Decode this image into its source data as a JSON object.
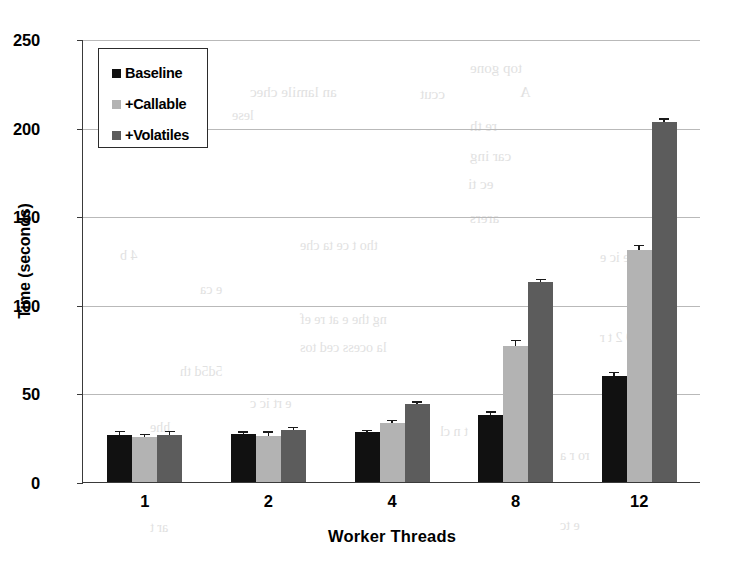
{
  "chart_data": {
    "type": "bar",
    "title": "",
    "xlabel": "Worker Threads",
    "ylabel": "Time (seconds)",
    "categories": [
      "1",
      "2",
      "4",
      "8",
      "12"
    ],
    "ylim": [
      0,
      250
    ],
    "yticks": [
      0,
      50,
      100,
      150,
      200,
      250
    ],
    "grid": true,
    "legend_position": "upper-left-inside",
    "series": [
      {
        "name": "Baseline",
        "color": "#111111",
        "values": [
          26.5,
          27.0,
          28.0,
          38.0,
          60.0
        ],
        "errors": [
          1.5,
          0.8,
          0.8,
          1.2,
          1.5
        ]
      },
      {
        "name": "+Callable",
        "color": "#b3b3b3",
        "values": [
          25.5,
          26.0,
          33.5,
          77.0,
          131.0
        ],
        "errors": [
          1.0,
          1.8,
          0.8,
          2.5,
          2.0
        ]
      },
      {
        "name": "+Volatiles",
        "color": "#5c5c5c",
        "values": [
          26.5,
          29.5,
          44.0,
          113.0,
          203.0
        ],
        "errors": [
          1.5,
          0.8,
          0.8,
          1.0,
          1.5
        ]
      }
    ]
  },
  "ghost_text": [
    {
      "text": "top gone",
      "x": 470,
      "y": 60,
      "size": 15
    },
    {
      "text": "ered cer",
      "x": 100,
      "y": 86,
      "size": 16
    },
    {
      "text": "an lamile chec",
      "x": 250,
      "y": 84,
      "size": 15
    },
    {
      "text": "ccut",
      "x": 420,
      "y": 86,
      "size": 15
    },
    {
      "text": "A",
      "x": 520,
      "y": 84,
      "size": 15
    },
    {
      "text": "lese",
      "x": 232,
      "y": 108,
      "size": 14
    },
    {
      "text": "re th",
      "x": 470,
      "y": 118,
      "size": 15
    },
    {
      "text": "car ing",
      "x": 470,
      "y": 148,
      "size": 15
    },
    {
      "text": "ec ti",
      "x": 468,
      "y": 176,
      "size": 15
    },
    {
      "text": "arers",
      "x": 470,
      "y": 210,
      "size": 15
    },
    {
      "text": "tho t ce ta che",
      "x": 300,
      "y": 238,
      "size": 14
    },
    {
      "text": "4 b",
      "x": 120,
      "y": 248,
      "size": 14
    },
    {
      "text": "e ca",
      "x": 200,
      "y": 282,
      "size": 14
    },
    {
      "text": "ng the e at re ef",
      "x": 300,
      "y": 312,
      "size": 14
    },
    {
      "text": "la ocess ced tos",
      "x": 300,
      "y": 340,
      "size": 14
    },
    {
      "text": "5d5d th",
      "x": 180,
      "y": 364,
      "size": 14
    },
    {
      "text": "e rt ic c",
      "x": 250,
      "y": 396,
      "size": 14
    },
    {
      "text": "hhe",
      "x": 150,
      "y": 420,
      "size": 14
    },
    {
      "text": "t n cl",
      "x": 440,
      "y": 424,
      "size": 14
    },
    {
      "text": "ro r a",
      "x": 560,
      "y": 448,
      "size": 14
    },
    {
      "text": "ar t",
      "x": 150,
      "y": 520,
      "size": 14
    },
    {
      "text": "e tc",
      "x": 560,
      "y": 518,
      "size": 14
    },
    {
      "text": "e ic e",
      "x": 600,
      "y": 250,
      "size": 14
    },
    {
      "text": "9 2 t r",
      "x": 600,
      "y": 330,
      "size": 14
    }
  ]
}
